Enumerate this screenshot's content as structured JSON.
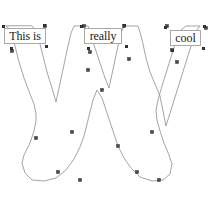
{
  "canvas": {
    "width": 215,
    "height": 219,
    "background_color": "#ffffff",
    "tool_context": "vector-path-editor"
  },
  "style": {
    "path_stroke_color": "#9a9a9a",
    "path_stroke_width": 0.9,
    "path_fill": "none",
    "anchor_fill_color": "#4a4a4a",
    "anchor_stroke_color": "#2e2e2e",
    "label_background_color": "#ffffff",
    "label_border_color": "#a8a8a8",
    "label_text_color": "#1b1b1b"
  },
  "shape": {
    "name": "letter-w-outline",
    "description": "Outline path of the capital letter W",
    "path_d": "M 6 26 L 11 30 L 15 46 L 19 62 L 24 78 L 30 94 L 34 104 L 36 114 L 36 121 L 34 131 L 30 143 L 24 155 L 22 163 L 25 173 L 32 180 L 44 181 L 56 178 L 66 170 L 74 159 L 80 147 L 84 136 L 87 124 L 90 112 L 93 100 L 97 90 L 102 98 L 106 110 L 110 122 L 114 134 L 118 146 L 124 158 L 131 168 L 140 177 L 152 181 L 163 180 L 170 174 L 172 164 L 169 155 L 164 143 L 160 131 L 157 120 L 156 110 L 158 100 L 162 86 L 167 70 L 172 54 L 177 38 L 181 30 L 186 26 L 200 26 L 196 31 L 191 46 L 186 62 L 181 78 L 176 94 L 171 110 L 166 126 L 160 96 L 155 84 L 150 72 L 146 58 L 143 44 L 140 32 L 138 26 L 124 26 L 121 33 L 118 46 L 115 60 L 112 74 L 109 88 L 105 78 L 101 66 L 97 54 L 93 42 L 90 32 L 88 26 L 74 26 L 71 33 L 68 46 L 65 60 L 62 74 L 59 88 L 56 102 L 52 88 L 47 72 L 43 56 L 39 40 L 36 30 L 32 26 Z",
    "anchor_points": [
      {
        "x": 45,
        "y": 26
      },
      {
        "x": 12,
        "y": 51
      },
      {
        "x": 36,
        "y": 138
      },
      {
        "x": 58,
        "y": 172
      },
      {
        "x": 80,
        "y": 180
      },
      {
        "x": 72,
        "y": 132
      },
      {
        "x": 84,
        "y": 26
      },
      {
        "x": 90,
        "y": 52
      },
      {
        "x": 88,
        "y": 70
      },
      {
        "x": 102,
        "y": 90
      },
      {
        "x": 124,
        "y": 26
      },
      {
        "x": 129,
        "y": 59
      },
      {
        "x": 118,
        "y": 146
      },
      {
        "x": 152,
        "y": 132
      },
      {
        "x": 137,
        "y": 172
      },
      {
        "x": 159,
        "y": 180
      },
      {
        "x": 167,
        "y": 26
      },
      {
        "x": 172,
        "y": 50
      },
      {
        "x": 177,
        "y": 62
      },
      {
        "x": 206,
        "y": 28
      }
    ]
  },
  "labels": [
    {
      "id": "label-this-is",
      "text": "This is",
      "x": 4,
      "y": 28,
      "width": 42,
      "height": 16,
      "corner_anchors": [
        {
          "x": 3,
          "y": 26
        },
        {
          "x": 44,
          "y": 25
        },
        {
          "x": 11,
          "y": 48
        },
        {
          "x": 46,
          "y": 46
        }
      ]
    },
    {
      "id": "label-really",
      "text": "really",
      "x": 84,
      "y": 28,
      "width": 38,
      "height": 16,
      "corner_anchors": [
        {
          "x": 81,
          "y": 26
        },
        {
          "x": 124,
          "y": 25
        },
        {
          "x": 88,
          "y": 48
        },
        {
          "x": 126,
          "y": 46
        }
      ]
    },
    {
      "id": "label-cool",
      "text": "cool",
      "x": 170,
      "y": 30,
      "width": 31,
      "height": 16,
      "corner_anchors": [
        {
          "x": 165,
          "y": 27
        },
        {
          "x": 204,
          "y": 26
        },
        {
          "x": 172,
          "y": 50
        },
        {
          "x": 203,
          "y": 48
        }
      ]
    }
  ]
}
